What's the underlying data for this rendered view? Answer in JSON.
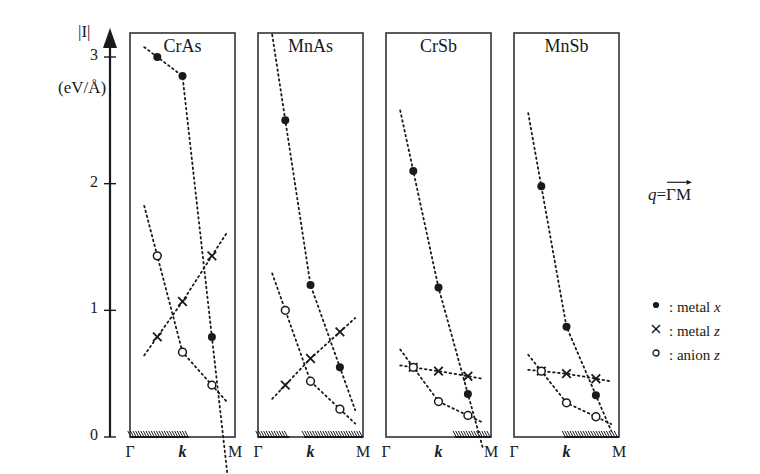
{
  "figure": {
    "y_axis": {
      "label": "|I|",
      "unit": "(eV/Å)",
      "ticks": [
        "0",
        "1",
        "2",
        "3"
      ],
      "tick_values": [
        0,
        1,
        2,
        3
      ],
      "range": [
        0,
        3.15
      ]
    },
    "x_axis": {
      "ticks": [
        "Γ",
        "k",
        "M"
      ],
      "label_k_style": "bold-italic"
    },
    "legend": {
      "q_prefix": "q",
      "q_equals": "=",
      "q_path": "ΓM",
      "q_full": "q = ΓM",
      "entries": [
        {
          "marker": "filled-circle",
          "glyph": "●",
          "label_prefix": ": metal ",
          "label_symbol": "x"
        },
        {
          "marker": "cross",
          "glyph": "×",
          "label_prefix": ": metal ",
          "label_symbol": "z"
        },
        {
          "marker": "open-circle",
          "glyph": "○",
          "label_prefix": ": anion ",
          "label_symbol": "z"
        }
      ]
    }
  },
  "chart_data": {
    "type": "scatter",
    "title": "",
    "xlabel": "k",
    "ylabel": "|I| (eV/Å)",
    "ylim": [
      0,
      3.15
    ],
    "xlim": [
      0,
      1
    ],
    "grid": false,
    "legend_position": "right",
    "x_tick_labels": [
      "Γ",
      "k",
      "M"
    ],
    "x_tick_positions": [
      0,
      0.5,
      1
    ],
    "panels": [
      {
        "name": "CrAs",
        "hatch_start": 0.0,
        "hatch_end": 0.56,
        "series": [
          {
            "name": "metal x",
            "marker": "filled-circle",
            "x": [
              0.26,
              0.5,
              0.78
            ],
            "y": [
              3.0,
              2.85,
              0.79
            ]
          },
          {
            "name": "metal z",
            "marker": "cross",
            "x": [
              0.26,
              0.5,
              0.78
            ],
            "y": [
              0.79,
              1.07,
              1.43
            ]
          },
          {
            "name": "anion z",
            "marker": "open-circle",
            "x": [
              0.26,
              0.5,
              0.78
            ],
            "y": [
              1.43,
              0.67,
              0.41
            ]
          }
        ]
      },
      {
        "name": "MnAs",
        "hatch_start": 0.0,
        "hatch_end": 0.3,
        "hatch_start_2": 0.44,
        "hatch_end_2": 1.0,
        "series": [
          {
            "name": "metal x",
            "marker": "filled-circle",
            "x": [
              0.26,
              0.5,
              0.78
            ],
            "y": [
              2.5,
              1.2,
              0.55
            ]
          },
          {
            "name": "metal z",
            "marker": "cross",
            "x": [
              0.26,
              0.5,
              0.78
            ],
            "y": [
              0.41,
              0.62,
              0.83
            ]
          },
          {
            "name": "anion z",
            "marker": "open-circle",
            "x": [
              0.26,
              0.5,
              0.78
            ],
            "y": [
              1.0,
              0.44,
              0.22
            ]
          }
        ]
      },
      {
        "name": "CrSb",
        "hatch_start": 0.66,
        "hatch_end": 1.0,
        "series": [
          {
            "name": "metal x",
            "marker": "filled-circle",
            "x": [
              0.26,
              0.5,
              0.78
            ],
            "y": [
              2.1,
              1.18,
              0.34
            ]
          },
          {
            "name": "metal z",
            "marker": "cross",
            "x": [
              0.26,
              0.5,
              0.78
            ],
            "y": [
              0.55,
              0.52,
              0.48
            ]
          },
          {
            "name": "anion z",
            "marker": "open-circle",
            "x": [
              0.26,
              0.5,
              0.78
            ],
            "y": [
              0.55,
              0.28,
              0.17
            ]
          }
        ]
      },
      {
        "name": "MnSb",
        "hatch_start": 0.48,
        "hatch_end": 1.0,
        "series": [
          {
            "name": "metal x",
            "marker": "filled-circle",
            "x": [
              0.26,
              0.5,
              0.78
            ],
            "y": [
              1.98,
              0.87,
              0.33
            ]
          },
          {
            "name": "metal z",
            "marker": "cross",
            "x": [
              0.26,
              0.5,
              0.78
            ],
            "y": [
              0.52,
              0.5,
              0.46
            ]
          },
          {
            "name": "anion z",
            "marker": "open-circle",
            "x": [
              0.26,
              0.5,
              0.78
            ],
            "y": [
              0.52,
              0.27,
              0.16
            ]
          }
        ]
      }
    ]
  }
}
